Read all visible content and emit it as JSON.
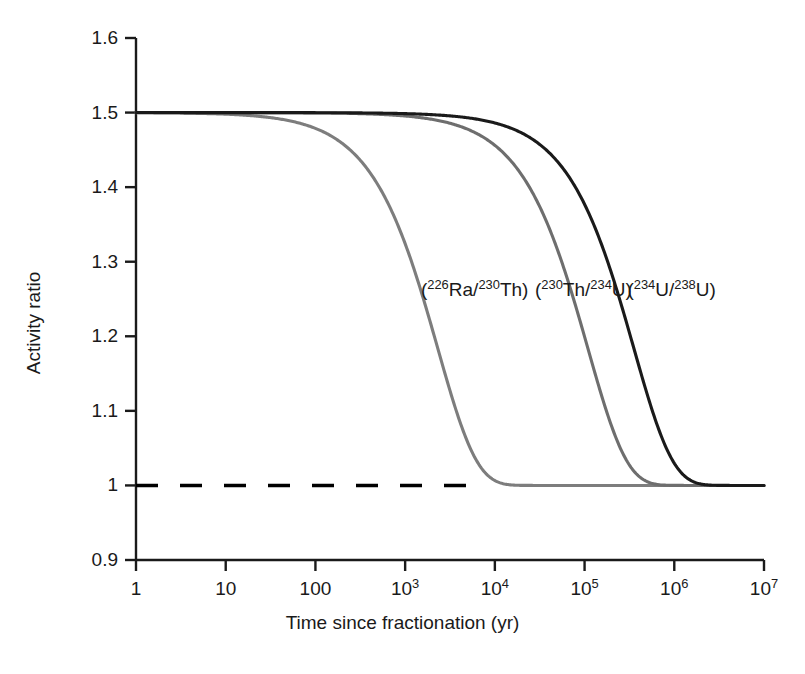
{
  "chart_data": {
    "type": "line",
    "title": "",
    "xlabel": "Time since fractionation (yr)",
    "ylabel": "Activity ratio",
    "xscale": "log",
    "xlim": [
      1,
      10000000
    ],
    "ylim": [
      0.9,
      1.6
    ],
    "grid": false,
    "legend_position": "inline-annotations",
    "xticks": [
      1,
      10,
      100,
      1000,
      10000,
      100000,
      1000000,
      10000000
    ],
    "xtick_labels": [
      "1",
      "10",
      "100",
      "10^3",
      "10^4",
      "10^5",
      "10^6",
      "10^7"
    ],
    "yticks": [
      0.9,
      1.0,
      1.1,
      1.2,
      1.3,
      1.4,
      1.5,
      1.6
    ],
    "ytick_labels": [
      "0.9",
      "1",
      "1.1",
      "1.2",
      "1.3",
      "1.4",
      "1.5",
      "1.6"
    ],
    "initial_ratio": 1.5,
    "equilibrium_ratio": 1.0,
    "reference_line": {
      "name": "secular-equilibrium",
      "y": 1.0,
      "style": "dashed",
      "color": "#000000"
    },
    "series": [
      {
        "name": "(226Ra/230Th)",
        "label_html": "(<sup>226</sup>Ra/<sup>230</sup>Th)",
        "color": "#7d7d7d",
        "half_life_yr": 1600,
        "label_x": 1500,
        "label_y": 1.262,
        "x": [
          1,
          10,
          100,
          200,
          400,
          700,
          1000,
          1500,
          2000,
          3000,
          4000,
          5000,
          7000,
          10000,
          20000,
          50000,
          100000,
          1000000,
          10000000
        ],
        "y": [
          1.5,
          1.4985,
          1.4788,
          1.4583,
          1.4195,
          1.3659,
          1.3177,
          1.25,
          1.1968,
          1.1327,
          1.0884,
          1.0572,
          1.0239,
          1.0065,
          1.0001,
          1.0,
          1.0,
          1.0,
          1.0
        ]
      },
      {
        "name": "(230Th/234U)",
        "label_html": "(<sup>230</sup>Th/<sup>234</sup>U)",
        "color": "#6e6e6e",
        "half_life_yr": 75400,
        "label_x": 28000,
        "label_y": 1.262,
        "x": [
          1,
          100,
          1000,
          5000,
          10000,
          20000,
          40000,
          60000,
          75400,
          100000,
          150000,
          200000,
          300000,
          500000,
          1000000,
          2000000,
          10000000
        ],
        "y": [
          1.5,
          1.5,
          1.4954,
          1.4773,
          1.456,
          1.4167,
          1.3467,
          1.2947,
          1.25,
          1.2015,
          1.146,
          1.1192,
          1.0797,
          1.05,
          1.005,
          1.0001,
          1.0
        ]
      },
      {
        "name": "(234U/238U)",
        "label_html": "(<sup>234</sup>U/<sup>238</sup>U)",
        "color": "#1a1a1a",
        "half_life_yr": 245500,
        "label_x": 300000,
        "label_y": 1.262,
        "x": [
          1,
          1000,
          10000,
          50000,
          100000,
          150000,
          200000,
          245500,
          300000,
          400000,
          600000,
          800000,
          1000000,
          1500000,
          2000000,
          3000000,
          5000000,
          10000000
        ],
        "y": [
          1.5,
          1.4986,
          1.486,
          1.432,
          1.3721,
          1.3186,
          1.2709,
          1.25,
          1.2049,
          1.1718,
          1.1215,
          1.0869,
          1.0627,
          1.028,
          1.0125,
          1.0025,
          1.0001,
          1.0
        ]
      }
    ]
  },
  "axes": {
    "y_title": "Activity ratio",
    "x_title": "Time since fractionation (yr)"
  }
}
